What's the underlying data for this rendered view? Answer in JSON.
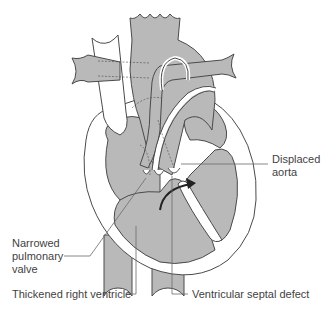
{
  "figure": {
    "colors": {
      "fill": "#b9b9b9",
      "outline": "#4a4a4a",
      "leader_line": "#6b6b6b",
      "text": "#3f3f3f",
      "background": "#ffffff"
    }
  },
  "labels": {
    "displaced_aorta": {
      "line1": "Displaced",
      "line2": "aorta"
    },
    "narrowed_pulmonary_valve": {
      "line1": "Narrowed",
      "line2": "pulmonary",
      "line3": "valve"
    },
    "thickened_right_ventricle": {
      "text": "Thickened right ventricle"
    },
    "ventricular_septal_defect": {
      "text": "Ventricular septal defect"
    }
  }
}
